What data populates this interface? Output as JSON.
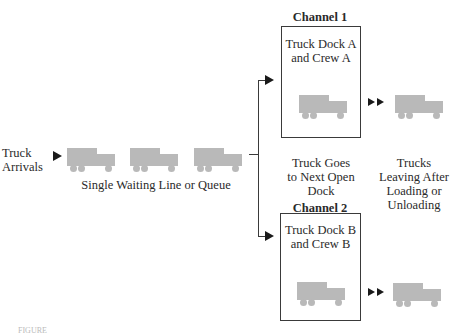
{
  "diagram": {
    "arrivals_label_line1": "Truck",
    "arrivals_label_line2": "Arrivals",
    "queue_label": "Single Waiting Line or Queue",
    "routing_label_line1": "Truck Goes",
    "routing_label_line2": "to Next Open",
    "routing_label_line3": "Dock",
    "leaving_label_line1": "Trucks",
    "leaving_label_line2": "Leaving After",
    "leaving_label_line3": "Loading or",
    "leaving_label_line4": "Unloading",
    "channels": [
      {
        "title": "Channel 1",
        "line1": "Truck Dock A",
        "line2": "and Crew A"
      },
      {
        "title": "Channel 2",
        "line1": "Truck Dock B",
        "line2": "and Crew B"
      }
    ],
    "caption": "FIGURE"
  },
  "colors": {
    "truck": "#b9b9b9",
    "line": "#3a3a3a",
    "arrow": "#1a1a1a"
  }
}
